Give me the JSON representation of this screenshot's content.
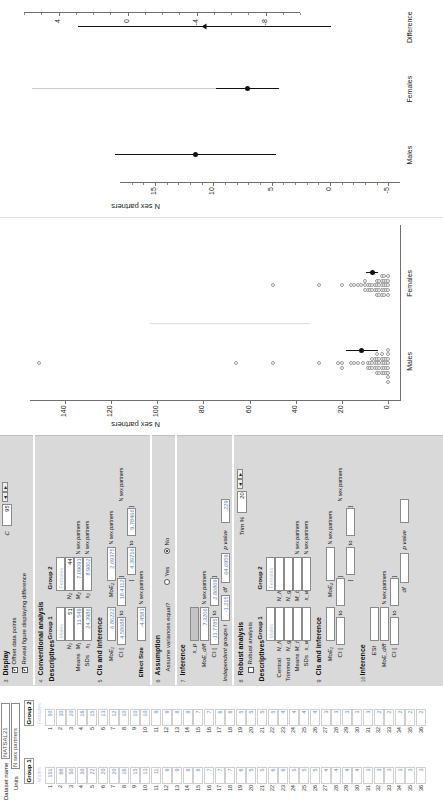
{
  "sheet": {
    "dataset_label": "Dataset name",
    "dataset_value": "NATSAL21",
    "units_label": "Units",
    "units_value": "N sex partners",
    "group1_header": "Group 1",
    "group1_name": "Males",
    "group2_header": "Group 2",
    "group2_name": "Females",
    "row_numbers": [
      1,
      2,
      3,
      4,
      5,
      6,
      7,
      8,
      9,
      10,
      11,
      12,
      13,
      14,
      15,
      16,
      17,
      18,
      19,
      20,
      21,
      22,
      23,
      24,
      25,
      26,
      27,
      28,
      29,
      30,
      31,
      32,
      33,
      34,
      35,
      36
    ],
    "group1_values": [
      151,
      66,
      50,
      30,
      22,
      20,
      20,
      16,
      15,
      13,
      11,
      9,
      9,
      8,
      8,
      7,
      7,
      7,
      6,
      5,
      5,
      6,
      6,
      5,
      5,
      5,
      4,
      4,
      4,
      4,
      3,
      3,
      3,
      3,
      3,
      3
    ],
    "group2_values": [
      50,
      30,
      20,
      16,
      15,
      13,
      12,
      10,
      10,
      10,
      9,
      9,
      8,
      8,
      7,
      7,
      6,
      6,
      5,
      5,
      5,
      5,
      4,
      4,
      4,
      4,
      3,
      3,
      3,
      3,
      3,
      2,
      2,
      2,
      2,
      2
    ]
  },
  "controls": {
    "display": {
      "section_number": "3",
      "title": "Display",
      "offset_points_label": "Offset data points",
      "offset_points_checked": true,
      "reveal_label": "Reveal figure displaying difference",
      "reveal_checked": true,
      "c_label": "C",
      "c_value": "95"
    },
    "conventional": {
      "section_number": "4",
      "title": "Conventional analysis",
      "descriptives_label": "Descriptives",
      "group1_header": "Group 1",
      "group1_name": "Males",
      "group2_header": "Group 2",
      "group2_name": "Females",
      "means_label": "Means",
      "sds_label": "SDs",
      "n1_sym": "N₁",
      "n2_sym": "N₂",
      "m1_sym": "M₁",
      "m2_sym": "M₂",
      "s1_sym": "s₁",
      "s2_sym": "s₂",
      "n1": "51",
      "n2": "44",
      "m1": "11.549",
      "m2": "7.09091",
      "s1": "24.3986",
      "s2": "8.9602",
      "units1": "N sex partners",
      "units2": "N sex partners"
    },
    "cis": {
      "section_number": "5",
      "title": "CIs and inference",
      "moe1_sym": "MoE₁",
      "moe1": "6.86222",
      "ci1_label": "CI [",
      "ci1_lo": "4.58688",
      "ci1_to": "to",
      "ci1_hi": "18.4112",
      "ci1_close": "]",
      "moe2_sym": "MoE₂",
      "moe2": "2.69375",
      "ci2_label": "[",
      "ci2_lo": "4.39716",
      "ci2_to": "to",
      "ci2_hi": "9.78466",
      "ci2_close": "]",
      "units1": "N sex partners",
      "units2": "N sex partners",
      "effect_size_label": "Effect Size",
      "effect_size": "-4.4581",
      "effect_units": "N sex partners"
    },
    "assumption": {
      "section_number": "6",
      "title": "Assumption",
      "question": "Assume variances equal?",
      "yes_label": "Yes",
      "no_label": "No",
      "selected": "No"
    },
    "inference": {
      "section_number": "7",
      "title": "Inference",
      "sp_sym": "s_p",
      "moediff_sym": "MoE_diff",
      "moediff": "7.3206",
      "units": "N sex partners",
      "ci_label": "CI [",
      "ci_lo": "-11.7785",
      "ci_to": "to",
      "ci_hi": "2.86869",
      "ci_close": "]",
      "groups_label": "Independent groups t",
      "t_value": "-1.215",
      "df_label": "df",
      "df_value": "64.6959",
      "p_label": "p value",
      "p_value": ".229"
    },
    "robust": {
      "section_number": "8",
      "title": "Robust analysis",
      "enable_label": "Robust analysis",
      "enable_checked": false,
      "trim_label": "Trim %",
      "trim_value": "20",
      "descriptives_label": "Descriptives",
      "group1_header": "Group 1",
      "group1_name": "Males",
      "group2_header": "Group 2",
      "group2_name": "Females",
      "central_label": "Central",
      "trimmed_label": "Trimmed",
      "means_label": "Means",
      "sds_label": "SDs",
      "nh1_sym": "N_h1",
      "nh2_sym": "N_h2",
      "ng1_sym": "N_g1",
      "ng2_sym": "N_g2",
      "mt1_sym": "M_t1",
      "mt2_sym": "M_t2",
      "sw1_sym": "s_w1",
      "sw2_sym": "s_w2",
      "units1": "N sex partners",
      "units2": "N sex partners"
    },
    "robust_cis": {
      "section_number": "9",
      "title": "CIs and inference",
      "moe1_sym": "MoE₁",
      "ci1_label": "CI [",
      "ci1_to": "to",
      "ci1_close": "]",
      "moe2_sym": "MoE₂",
      "ci2_label": "[",
      "ci2_to": "to",
      "ci2_close": "]",
      "units1": "N sex partners",
      "units2": "N sex partners"
    },
    "robust_inference": {
      "section_number": "10",
      "title": "Inference",
      "es_sym": "ESt",
      "moediff_sym": "MoE_diff",
      "units": "N sex partners",
      "ci_label": "CI [",
      "ci_to": "to",
      "ci_close": "]",
      "df_label": "df",
      "p_label": "p value"
    }
  },
  "chart_data": [
    {
      "type": "scatter",
      "name": "raw-data-dot-plot",
      "title": "",
      "ylabel": "N sex partners",
      "xlabel": "",
      "categories": [
        "Males",
        "Females"
      ],
      "yticks": [
        0,
        20,
        40,
        60,
        80,
        100,
        120,
        140
      ],
      "ylim": [
        -5,
        155
      ],
      "grid": false,
      "series": [
        {
          "name": "Males",
          "values": [
            151,
            66,
            50,
            30,
            22,
            20,
            20,
            16,
            15,
            13,
            11,
            9,
            9,
            8,
            8,
            7,
            7,
            7,
            6,
            6,
            6,
            5,
            5,
            5,
            5,
            5,
            4,
            4,
            4,
            4,
            3,
            3,
            3,
            3,
            3,
            2,
            2,
            2,
            2,
            1,
            1,
            1,
            1,
            0,
            0,
            0,
            0,
            0,
            0,
            0,
            0
          ],
          "mean": 11.549,
          "ci_low": 4.587,
          "ci_high": 18.411
        },
        {
          "name": "Females",
          "values": [
            50,
            30,
            20,
            16,
            15,
            13,
            12,
            10,
            10,
            10,
            9,
            9,
            8,
            8,
            7,
            7,
            6,
            6,
            5,
            5,
            5,
            5,
            4,
            4,
            4,
            4,
            3,
            3,
            3,
            3,
            3,
            2,
            2,
            2,
            2,
            2,
            1,
            1,
            1,
            0,
            0,
            0,
            0,
            0
          ],
          "mean": 7.091,
          "ci_low": 4.397,
          "ci_high": 9.785
        }
      ]
    },
    {
      "type": "scatter",
      "name": "estimation-difference-plot",
      "title": "",
      "ylabel": "N sex partners",
      "xlabel": "",
      "categories": [
        "Males",
        "Females",
        "Difference"
      ],
      "yticks_main": [
        -5,
        0,
        5,
        10,
        15
      ],
      "ylim_main": [
        -6,
        18
      ],
      "yticks_diff": [
        -8,
        -4,
        0,
        4
      ],
      "ylim_diff": [
        -10,
        6
      ],
      "grid": false,
      "points": [
        {
          "label": "Males",
          "mean": 11.549,
          "ci_low": 4.587,
          "ci_high": 18.411
        },
        {
          "label": "Females",
          "mean": 7.091,
          "ci_low": 4.397,
          "ci_high": 9.785
        },
        {
          "label": "Difference",
          "mean": -4.4581,
          "ci_low": -11.7785,
          "ci_high": 2.86869
        }
      ]
    }
  ]
}
